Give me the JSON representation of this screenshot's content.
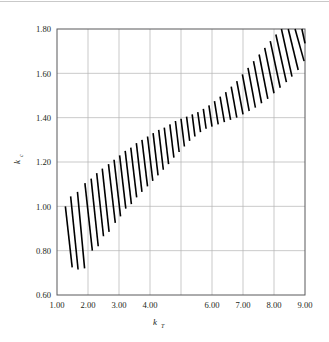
{
  "chart_data": {
    "type": "area",
    "title": "",
    "subtitle": "",
    "xlabel": "k_T",
    "xlabel_base": "k",
    "xlabel_sub": "T",
    "ylabel": "k_c",
    "ylabel_base": "k",
    "ylabel_sub": "c",
    "xlim": [
      1.0,
      9.0
    ],
    "ylim": [
      0.6,
      1.8
    ],
    "xticks": [
      1.0,
      2.0,
      3.0,
      4.0,
      5.0,
      6.0,
      7.0,
      8.0,
      9.0
    ],
    "yticks": [
      0.6,
      0.8,
      1.0,
      1.2,
      1.4,
      1.6,
      1.8
    ],
    "xtick_labels": [
      "1.00",
      "2.00",
      "3.00",
      "4.00",
      "",
      "6.00",
      "7.00",
      "8.00",
      "9.00"
    ],
    "ytick_labels": [
      "0.60",
      "0.80",
      "1.00",
      "1.20",
      "1.40",
      "1.60",
      "1.80"
    ],
    "grid": true,
    "grid_color": "#b3b3b3",
    "frame_color": "#58595b",
    "legend": "none",
    "series": [
      {
        "name": "hatched band",
        "style": "diagonal-hatch",
        "hatch_color": "#000000",
        "hatch_line_width": 1.6,
        "description": "Band of diagonally hatched strokes rising from lower-left to upper-right; band is widest at the two ends and narrowest near k_T = 5.5",
        "upper_boundary": {
          "x": [
            1.25,
            1.6,
            2.0,
            2.5,
            3.0,
            3.5,
            4.0,
            4.5,
            5.0,
            5.5,
            6.0,
            6.5,
            7.0,
            7.5,
            8.0,
            8.5,
            9.0
          ],
          "y": [
            1.0,
            1.06,
            1.115,
            1.175,
            1.225,
            1.27,
            1.315,
            1.355,
            1.39,
            1.425,
            1.47,
            1.525,
            1.6,
            1.675,
            1.745,
            1.8,
            1.8
          ]
        },
        "lower_boundary": {
          "x": [
            1.25,
            1.6,
            2.0,
            2.5,
            3.0,
            3.5,
            4.0,
            4.5,
            5.0,
            5.5,
            6.0,
            6.5,
            7.0,
            7.5,
            8.0,
            8.5,
            9.0
          ],
          "y": [
            0.72,
            0.715,
            0.8,
            0.875,
            0.955,
            1.015,
            1.075,
            1.14,
            1.21,
            1.29,
            1.355,
            1.405,
            1.44,
            1.485,
            1.545,
            1.625,
            1.72
          ]
        },
        "hatch_strokes": [
          {
            "x1": 1.27,
            "y1": 1.0,
            "x2": 1.49,
            "y2": 0.725
          },
          {
            "x1": 1.44,
            "y1": 1.045,
            "x2": 1.68,
            "y2": 0.715
          },
          {
            "x1": 1.66,
            "y1": 1.065,
            "x2": 1.89,
            "y2": 0.72
          },
          {
            "x1": 1.9,
            "y1": 1.105,
            "x2": 2.14,
            "y2": 0.8
          },
          {
            "x1": 2.1,
            "y1": 1.125,
            "x2": 2.33,
            "y2": 0.82
          },
          {
            "x1": 2.28,
            "y1": 1.15,
            "x2": 2.5,
            "y2": 0.865
          },
          {
            "x1": 2.46,
            "y1": 1.17,
            "x2": 2.68,
            "y2": 0.885
          },
          {
            "x1": 2.66,
            "y1": 1.19,
            "x2": 2.88,
            "y2": 0.925
          },
          {
            "x1": 2.84,
            "y1": 1.21,
            "x2": 3.05,
            "y2": 0.955
          },
          {
            "x1": 3.02,
            "y1": 1.23,
            "x2": 3.22,
            "y2": 0.99
          },
          {
            "x1": 3.2,
            "y1": 1.25,
            "x2": 3.4,
            "y2": 1.01
          },
          {
            "x1": 3.38,
            "y1": 1.265,
            "x2": 3.57,
            "y2": 1.04
          },
          {
            "x1": 3.56,
            "y1": 1.285,
            "x2": 3.74,
            "y2": 1.065
          },
          {
            "x1": 3.74,
            "y1": 1.3,
            "x2": 3.92,
            "y2": 1.09
          },
          {
            "x1": 3.92,
            "y1": 1.315,
            "x2": 4.09,
            "y2": 1.115
          },
          {
            "x1": 4.1,
            "y1": 1.33,
            "x2": 4.26,
            "y2": 1.14
          },
          {
            "x1": 4.28,
            "y1": 1.345,
            "x2": 4.43,
            "y2": 1.165
          },
          {
            "x1": 4.46,
            "y1": 1.355,
            "x2": 4.6,
            "y2": 1.19
          },
          {
            "x1": 4.64,
            "y1": 1.37,
            "x2": 4.77,
            "y2": 1.22
          },
          {
            "x1": 4.82,
            "y1": 1.385,
            "x2": 4.94,
            "y2": 1.245
          },
          {
            "x1": 5.0,
            "y1": 1.395,
            "x2": 5.11,
            "y2": 1.27
          },
          {
            "x1": 5.18,
            "y1": 1.405,
            "x2": 5.28,
            "y2": 1.295
          },
          {
            "x1": 5.36,
            "y1": 1.415,
            "x2": 5.45,
            "y2": 1.315
          },
          {
            "x1": 5.54,
            "y1": 1.425,
            "x2": 5.63,
            "y2": 1.335
          },
          {
            "x1": 5.72,
            "y1": 1.44,
            "x2": 5.81,
            "y2": 1.35
          },
          {
            "x1": 5.9,
            "y1": 1.455,
            "x2": 6.0,
            "y2": 1.36
          },
          {
            "x1": 6.08,
            "y1": 1.475,
            "x2": 6.2,
            "y2": 1.37
          },
          {
            "x1": 6.26,
            "y1": 1.495,
            "x2": 6.4,
            "y2": 1.38
          },
          {
            "x1": 6.44,
            "y1": 1.515,
            "x2": 6.6,
            "y2": 1.39
          },
          {
            "x1": 6.62,
            "y1": 1.54,
            "x2": 6.8,
            "y2": 1.4
          },
          {
            "x1": 6.8,
            "y1": 1.565,
            "x2": 7.0,
            "y2": 1.415
          },
          {
            "x1": 6.98,
            "y1": 1.595,
            "x2": 7.2,
            "y2": 1.43
          },
          {
            "x1": 7.16,
            "y1": 1.625,
            "x2": 7.4,
            "y2": 1.445
          },
          {
            "x1": 7.34,
            "y1": 1.655,
            "x2": 7.6,
            "y2": 1.465
          },
          {
            "x1": 7.52,
            "y1": 1.685,
            "x2": 7.8,
            "y2": 1.485
          },
          {
            "x1": 7.7,
            "y1": 1.715,
            "x2": 8.0,
            "y2": 1.51
          },
          {
            "x1": 7.88,
            "y1": 1.745,
            "x2": 8.2,
            "y2": 1.535
          },
          {
            "x1": 8.06,
            "y1": 1.775,
            "x2": 8.4,
            "y2": 1.56
          },
          {
            "x1": 8.24,
            "y1": 1.8,
            "x2": 8.58,
            "y2": 1.585
          },
          {
            "x1": 8.46,
            "y1": 1.8,
            "x2": 8.78,
            "y2": 1.615
          },
          {
            "x1": 8.68,
            "y1": 1.8,
            "x2": 8.97,
            "y2": 1.655
          },
          {
            "x1": 8.9,
            "y1": 1.8,
            "x2": 9.0,
            "y2": 1.735
          }
        ]
      }
    ]
  },
  "plot": {
    "left_px": 57,
    "right_px": 305,
    "top_px": 29,
    "bottom_px": 295
  }
}
